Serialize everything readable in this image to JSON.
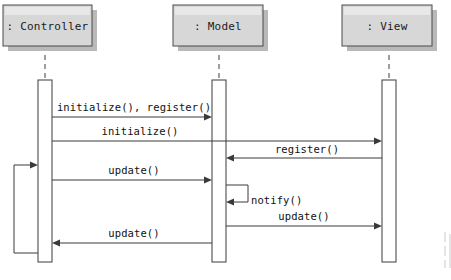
{
  "diagram": {
    "kind": "uml-sequence-diagram",
    "width": 451,
    "height": 280,
    "background_color": "#ffffff",
    "line_color": "#3a3a3a",
    "box_fill_color": "#d7d7d7",
    "box_border_color": "#4a4a4a",
    "shadow_color": "#b9b9b9",
    "lifeline_color": "#6a6a6a",
    "participants": [
      {
        "id": "controller",
        "label": ": Controller",
        "box_x": 3,
        "box_y": 5,
        "box_w": 89,
        "box_h": 41,
        "lifeline_x": 45,
        "activation_x": 38,
        "activation_y": 80,
        "activation_w": 14,
        "activation_h": 182
      },
      {
        "id": "model",
        "label": ": Model",
        "box_x": 173,
        "box_y": 5,
        "box_w": 90,
        "box_h": 41,
        "lifeline_x": 219,
        "activation_x": 212,
        "activation_y": 80,
        "activation_w": 14,
        "activation_h": 182
      },
      {
        "id": "view",
        "label": ": View",
        "box_x": 342,
        "box_y": 5,
        "box_w": 90,
        "box_h": 41,
        "lifeline_x": 389,
        "activation_x": 382,
        "activation_y": 80,
        "activation_w": 14,
        "activation_h": 182
      }
    ],
    "messages": [
      {
        "id": "m1",
        "label": "initialize(), register()",
        "from": "controller",
        "to": "model",
        "direction": "right",
        "y": 117,
        "label_y": 107,
        "x1": 52,
        "x2": 212,
        "label_x": 134
      },
      {
        "id": "m2",
        "label": "initialize()",
        "from": "controller",
        "to": "view",
        "direction": "right",
        "y": 141,
        "label_y": 133,
        "x1": 52,
        "x2": 382,
        "label_x": 140
      },
      {
        "id": "m3",
        "label": "register()",
        "from": "view",
        "to": "model",
        "direction": "left",
        "y": 158,
        "label_y": 151,
        "x1": 382,
        "x2": 226,
        "label_x": 307
      },
      {
        "id": "m4",
        "label": "update()",
        "from": "controller",
        "to": "model",
        "direction": "right",
        "y": 180,
        "label_y": 172,
        "x1": 52,
        "x2": 212,
        "label_x": 134
      },
      {
        "id": "m5",
        "label": "notify()",
        "from": "model",
        "to": "model",
        "direction": "self",
        "y": 185,
        "label_y": 204,
        "x1": 226,
        "x2": 248,
        "loop_top": 185,
        "loop_bottom": 202,
        "label_x": 251
      },
      {
        "id": "m6",
        "label": "update()",
        "from": "model",
        "to": "view",
        "direction": "right",
        "y": 226,
        "label_y": 218,
        "x1": 226,
        "x2": 382,
        "label_x": 304
      },
      {
        "id": "m7",
        "label": "update()",
        "from": "model",
        "to": "controller",
        "direction": "left",
        "y": 243,
        "label_y": 236,
        "x1": 212,
        "x2": 52,
        "label_x": 134
      },
      {
        "id": "m8",
        "label": "",
        "from": "controller",
        "to": "controller",
        "direction": "self-outer-left",
        "y": 165,
        "loop_left_x": 14,
        "loop_top": 165,
        "loop_bottom": 253,
        "label_x": 0,
        "label_y": 0
      }
    ]
  }
}
